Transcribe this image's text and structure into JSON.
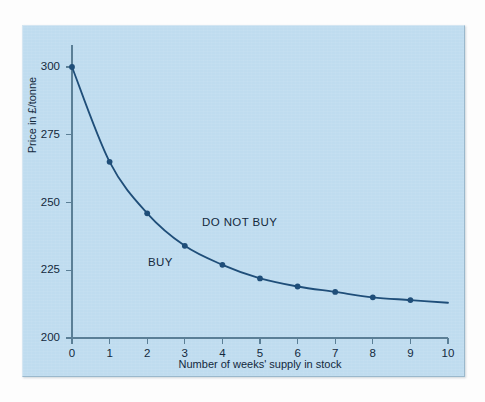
{
  "chart_data": {
    "type": "line",
    "title": "",
    "subtitle": "",
    "xlabel": "Number of weeks' supply in stock",
    "ylabel": "Price in £/tonne",
    "xlim": [
      0,
      10
    ],
    "ylim": [
      200,
      300
    ],
    "xticks": [
      0,
      1,
      2,
      3,
      4,
      5,
      6,
      7,
      8,
      9,
      10
    ],
    "xtick_labels": [
      "0",
      "1",
      "2",
      "3",
      "4",
      "5",
      "6",
      "7",
      "8",
      "9",
      "10"
    ],
    "yticks": [
      200,
      225,
      250,
      275,
      300
    ],
    "ytick_labels": [
      "200",
      "225",
      "250",
      "275",
      "300"
    ],
    "grid": false,
    "legend": false,
    "legend_position": "none",
    "series": [
      {
        "name": "Break-even price",
        "x": [
          0,
          1,
          2,
          3,
          4,
          5,
          6,
          7,
          8,
          9
        ],
        "values": [
          300,
          265,
          246,
          234,
          227,
          222,
          219,
          217,
          215,
          214
        ],
        "line_color": "#1f4e79",
        "marker": "circle",
        "marker_color": "#1f4e79",
        "extends_to_x": 10,
        "extends_to_y": 213
      }
    ],
    "annotations": [
      {
        "text": "DO NOT BUY",
        "x": 3.45,
        "y": 241
      },
      {
        "text": "BUY",
        "x": 2.0,
        "y": 228
      }
    ],
    "colors": {
      "panel_background": "#bfdcef",
      "axis": "#5b7f96",
      "curve": "#1f4e79",
      "text": "#13293d",
      "figure_background": "#fdfdfd"
    }
  }
}
